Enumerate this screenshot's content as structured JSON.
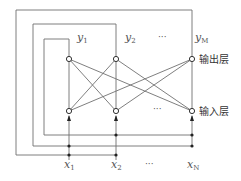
{
  "diagram": {
    "type": "hopfield-style feedback network",
    "colors": {
      "line": "#707070",
      "node_fill": "#ffffff",
      "node_stroke": "#333333",
      "dot": "#222222"
    },
    "layers": {
      "output": {
        "label": "输出层",
        "nodes": [
          {
            "id": "y1",
            "base": "y",
            "sub": "1",
            "x": 69
          },
          {
            "id": "y2",
            "base": "y",
            "sub": "2",
            "x": 116
          },
          {
            "id": "yM",
            "base": "y",
            "sub": "M",
            "x": 192
          }
        ],
        "ellipsis": "···",
        "y": 59
      },
      "input": {
        "label": "输入层",
        "nodes": [
          {
            "id": "x1",
            "x": 69
          },
          {
            "id": "x2",
            "x": 116
          },
          {
            "id": "xN",
            "x": 192
          }
        ],
        "ellipsis": "···",
        "y": 111
      }
    },
    "inputs": {
      "labels": [
        {
          "id": "x1",
          "base": "x",
          "sub": "1",
          "x": 69
        },
        {
          "id": "x2",
          "base": "x",
          "sub": "2",
          "x": 116
        },
        {
          "id": "xN",
          "base": "x",
          "sub": "N",
          "x": 192
        }
      ],
      "ellipsis": "···"
    },
    "feedback_loops": [
      {
        "from": "y1",
        "box": [
          44,
          39,
          69,
          135
        ],
        "feeds": [
          "x2",
          "xN"
        ]
      },
      {
        "from": "y2",
        "box": [
          33,
          24,
          116,
          146
        ],
        "feeds": [
          "x1",
          "xN"
        ]
      },
      {
        "from": "yM",
        "box": [
          16,
          10,
          192,
          155
        ],
        "feeds": [
          "x1",
          "x2"
        ]
      }
    ]
  }
}
